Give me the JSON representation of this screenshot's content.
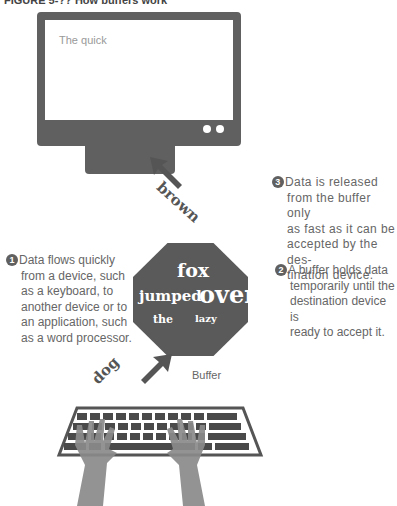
{
  "caption": "FIGURE 5-?? How buffers work",
  "monitor": {
    "screen_text": "The quick",
    "indicator_dots": 2
  },
  "buffer": {
    "label": "Buffer",
    "words": {
      "fox": "fox",
      "jumped": "jumped",
      "over": "over",
      "the": "the",
      "lazy": "lazy"
    }
  },
  "arrows": {
    "to_monitor": "brown",
    "from_keyboard": "dog"
  },
  "steps": [
    {
      "number": "1",
      "text_first": "Data flows quickly",
      "text_rest": [
        "from a device, such",
        "as a keyboard, to",
        "another device or to",
        "an application, such",
        "as a word processor."
      ]
    },
    {
      "number": "2",
      "text_first": "A buffer holds data",
      "text_rest": [
        "temporarily until the",
        "destination device is",
        "ready to accept it."
      ]
    },
    {
      "number": "3",
      "text_first": "Data is released",
      "text_rest": [
        "from the buffer only",
        "as fast as it can be",
        "accepted by the des-",
        "tination device."
      ]
    }
  ],
  "colors": {
    "device_gray": "#606060",
    "text_gray": "#666666",
    "hand_gray": "#8a8a8a"
  }
}
